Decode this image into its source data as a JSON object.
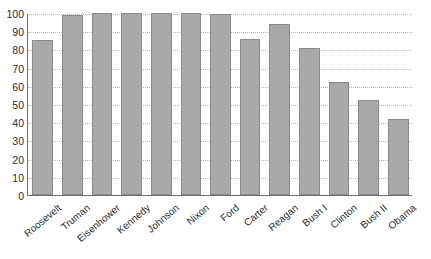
{
  "chart_data": {
    "type": "bar",
    "title": "",
    "subtitle": "",
    "xlabel": "",
    "ylabel": "",
    "ylim": [
      0,
      100
    ],
    "yticks": [
      0,
      10,
      20,
      30,
      40,
      50,
      60,
      70,
      80,
      90,
      100
    ],
    "grid": true,
    "legend": null,
    "bar_color": "#a9a9a9",
    "bar_border_color": "#8a8a8a",
    "axis_color": "#6f6f6f",
    "gridline_color": "#b9b9b9",
    "categories": [
      "Roosevelt",
      "Truman",
      "Eisenhower",
      "Kennedy",
      "Johnson",
      "Nixon",
      "Ford",
      "Carter",
      "Reagan",
      "Bush I",
      "Clinton",
      "Bush II",
      "Obama"
    ],
    "values": [
      85,
      99,
      100,
      100,
      100,
      100,
      99.5,
      85.5,
      94,
      81,
      62,
      52,
      41.5
    ]
  },
  "bottom_text": ""
}
